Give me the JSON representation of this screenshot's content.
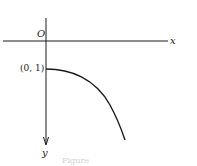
{
  "diagram": {
    "origin_label": "O",
    "x_axis_label": "x",
    "y_axis_label": "y",
    "point_label": "(0, 1)",
    "caption": "Figure",
    "note": "y-axis points downward; curve starts at (0,1) and bends downward to the right"
  },
  "colors": {
    "line": "#1a1a1a",
    "background": "#ffffff",
    "caption": "#d0d0d0"
  }
}
